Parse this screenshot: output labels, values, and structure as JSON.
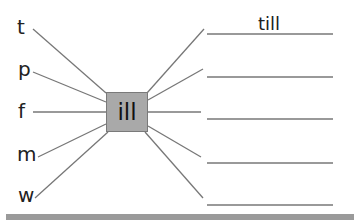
{
  "worksheet": {
    "center_word_ending": "ill",
    "onsets": [
      "t",
      "p",
      "f",
      "m",
      "w"
    ],
    "answers": [
      "till",
      "",
      "",
      "",
      ""
    ],
    "colors": {
      "box_fill": "#a9a9a9",
      "box_border": "#7a7a7a",
      "line": "#777777"
    }
  }
}
